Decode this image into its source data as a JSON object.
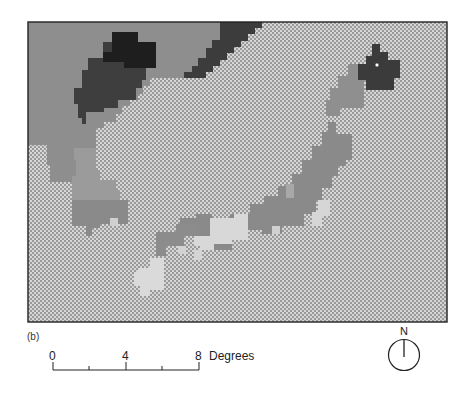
{
  "figure": {
    "panel_label": "(b)",
    "map": {
      "frame": {
        "x": 28,
        "y": 22,
        "width": 419,
        "height": 300
      },
      "colors": {
        "sea_pattern_bg": "#d4d4d4",
        "sea_pattern_dot": "#7a7a7a",
        "land_mid_gray": "#8c8c8c",
        "land_medium_gray": "#9a9a9a",
        "land_dark": "#3c3c3c",
        "land_darkest": "#1c1c1c",
        "land_light": "#d8d8d8",
        "land_grayish": "#808080"
      },
      "marker": {
        "type": "small-circle",
        "x": 377,
        "y": 65
      }
    },
    "scale_bar": {
      "ticks": [
        "0",
        "4",
        "8"
      ],
      "unit": "Degrees",
      "range": [
        0,
        8
      ],
      "minor_ticks": [
        2,
        6
      ]
    },
    "north_arrow": {
      "label": "N"
    }
  }
}
